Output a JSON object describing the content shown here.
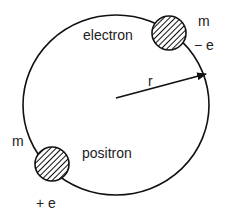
{
  "diagram": {
    "title": "",
    "type": "orbit",
    "colors": {
      "stroke": "#111111",
      "text": "#222222",
      "background": "#ffffff"
    },
    "orbit": {
      "label": "",
      "center": [
        116,
        105
      ],
      "rx": 93,
      "ry": 90
    },
    "particles": [
      {
        "name": "electron",
        "label": "electron",
        "mass_label": "m",
        "charge_label": "− e",
        "fill": "hatched"
      },
      {
        "name": "positron",
        "label": "positron",
        "mass_label": "m",
        "charge_label": "+ e",
        "fill": "hatched"
      }
    ],
    "radius_vector": {
      "label": "r"
    }
  }
}
